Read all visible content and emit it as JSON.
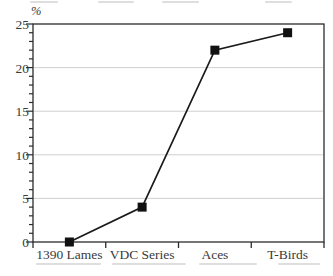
{
  "chart_data": {
    "type": "line",
    "categories": [
      "1390 Lames",
      "VDC Series",
      "Aces",
      "T-Birds"
    ],
    "values": [
      0,
      4,
      22,
      24
    ],
    "title": "",
    "xlabel": "",
    "ylabel": "%",
    "ylim": [
      0,
      25
    ],
    "yticks": [
      0,
      5,
      10,
      15,
      20,
      25
    ],
    "ytick_labels": [
      "0",
      "5",
      "10",
      "15",
      "20",
      "25"
    ],
    "minor_tick_step": 1,
    "grid": "horizontal-major",
    "legend": "none",
    "marker": "filled-square",
    "line_color": "#1a1a1a",
    "marker_color": "#111111",
    "frame_color": "#2b2b2b",
    "grid_color": "#c9c9c9",
    "text_color": "#3a3a3a"
  }
}
